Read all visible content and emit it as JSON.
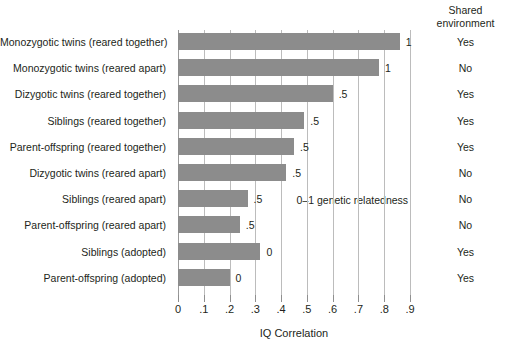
{
  "chart_data": {
    "type": "bar",
    "orientation": "horizontal",
    "title": "",
    "xlabel": "IQ Correlation",
    "ylabel": "",
    "xlim": [
      0,
      0.9
    ],
    "grid": true,
    "xticks": [
      "0",
      ".1",
      ".2",
      ".3",
      ".4",
      ".5",
      ".6",
      ".7",
      ".8",
      ".9"
    ],
    "xtick_values": [
      0,
      0.1,
      0.2,
      0.3,
      0.4,
      0.5,
      0.6,
      0.7,
      0.8,
      0.9
    ],
    "categories": [
      "Monozygotic twins (reared together)",
      "Monozygotic twins (reared apart)",
      "Dizygotic twins (reared together)",
      "Siblings (reared together)",
      "Parent-offspring (reared together)",
      "Dizygotic twins (reared apart)",
      "Siblings (reared apart)",
      "Parent-offspring (reared apart)",
      "Siblings (adopted)",
      "Parent-offspring (adopted)"
    ],
    "values": [
      0.86,
      0.78,
      0.6,
      0.49,
      0.45,
      0.42,
      0.27,
      0.24,
      0.32,
      0.2
    ],
    "data_labels": [
      "1",
      "1",
      ".5",
      ".5",
      ".5",
      ".5",
      ".5",
      ".5",
      "0",
      "0"
    ],
    "data_labels_meaning": "0–1 genetic relatedness",
    "annotation": "0–1 genetic relatedness",
    "bar_color": "#8c8c8c",
    "gridline_color": "#bcbcbc",
    "extra_column": {
      "header_line1": "Shared",
      "header_line2": "environment",
      "values": [
        "Yes",
        "No",
        "Yes",
        "Yes",
        "Yes",
        "No",
        "No",
        "No",
        "Yes",
        "Yes"
      ]
    }
  }
}
